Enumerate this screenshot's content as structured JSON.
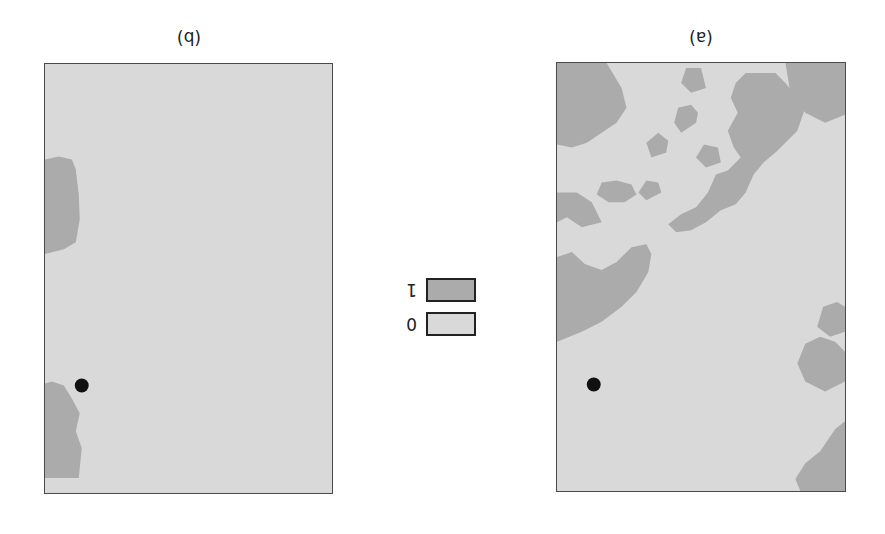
{
  "figure": {
    "panels": [
      {
        "id": "a",
        "label": "(a)",
        "description": "binary map with extensive class-1 regions (coastline, islands)"
      },
      {
        "id": "b",
        "label": "(b)",
        "description": "binary map with small class-1 regions along one edge"
      }
    ],
    "legend": {
      "items": [
        {
          "value": "1",
          "color": "#ababab"
        },
        {
          "value": "0",
          "color": "#d9d9d9"
        }
      ]
    },
    "marker": {
      "shape": "circle",
      "color": "#111111"
    },
    "colors": {
      "class0": "#d9d9d9",
      "class1": "#ababab",
      "frame": "#4a4a4a"
    }
  }
}
